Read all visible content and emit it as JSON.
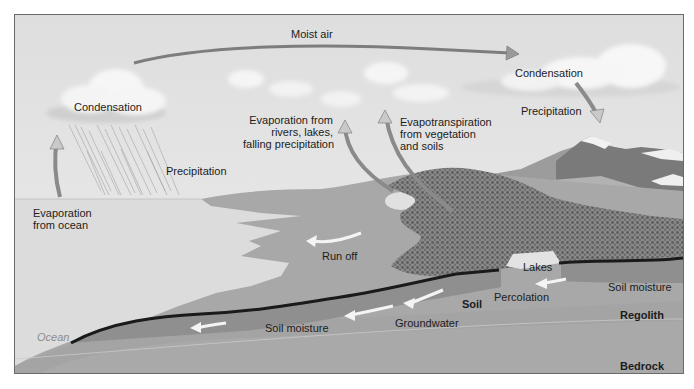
{
  "diagram": {
    "colors": {
      "sky": "#e4e4e4",
      "ocean": "#dcdcdc",
      "land": "#a8a8a8",
      "soil_moisture_band": "#8f8f8f",
      "regolith": "#a4a4a4",
      "bedrock": "#a9a9a9",
      "soil_line": "#1a1a1a",
      "arrow_fill": "#b5b5b5",
      "arrow_white": "#f4f4f4",
      "mountain": "#7d7d7d",
      "trees": "#6f6f6f",
      "lake": "#e2e2e2",
      "cloud": "#f7f7f7"
    },
    "labels": {
      "moist_air": "Moist air",
      "condensation_left": "Condensation",
      "condensation_right": "Condensation",
      "precipitation_left": "Precipitation",
      "precipitation_right": "Precipitation",
      "evap_ocean_1": "Evaporation",
      "evap_ocean_2": "from ocean",
      "evap_rivers_1": "Evaporation from",
      "evap_rivers_2": "rivers, lakes,",
      "evap_rivers_3": "falling precipitation",
      "evapotrans_1": "Evapotranspiration",
      "evapotrans_2": "from vegetation",
      "evapotrans_3": "and soils",
      "run_off": "Run off",
      "lakes": "Lakes",
      "soil_moisture_right": "Soil moisture",
      "soil_moisture_left": "Soil moisture",
      "percolation": "Percolation",
      "soil": "Soil",
      "groundwater": "Groundwater",
      "regolith": "Regolith",
      "bedrock": "Bedrock",
      "ocean": "Ocean"
    }
  }
}
